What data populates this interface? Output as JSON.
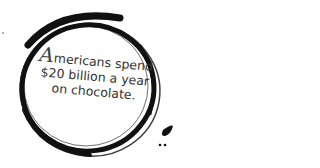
{
  "quote": {
    "drop_cap": "A",
    "line1": "mericans spend",
    "line2": "$20 billion a year",
    "line3": "on chocolate."
  },
  "colors": {
    "ink": "#111111",
    "text": "#333333",
    "background": "#ffffff"
  },
  "icons": [
    "brush-ring-icon",
    "ink-drop-icon"
  ]
}
